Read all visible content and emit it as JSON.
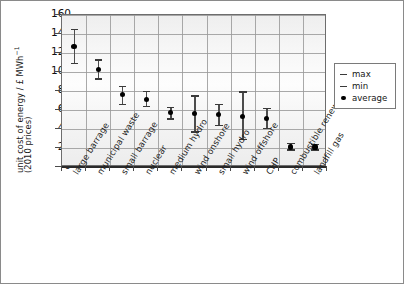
{
  "axis": {
    "y_title_line1": "unit cost of energy / £ MWh",
    "y_title_sup": "−1",
    "y_title_line2": "(2010 prices)",
    "y_ticks": [
      0,
      20,
      40,
      60,
      80,
      100,
      120,
      140,
      160
    ],
    "y_min": 0,
    "y_max": 160
  },
  "legend": {
    "position": "right",
    "items": [
      {
        "label": "max",
        "key": "dash"
      },
      {
        "label": "min",
        "key": "dash"
      },
      {
        "label": "average",
        "key": "dot"
      }
    ]
  },
  "colors": {
    "marker": "#000000",
    "errorbar": "#4c4c4c",
    "panel": "#f3f3f3",
    "grid": "#9a9a9a",
    "axis": "#2a2a2a"
  },
  "chart_data": {
    "type": "scatter",
    "title": "",
    "xlabel": "",
    "ylabel": "unit cost of energy / £ MWh−1 (2010 prices)",
    "ylim": [
      0,
      160
    ],
    "ytick_step": 20,
    "grid": true,
    "legend_position": "right",
    "categories": [
      "large barrage",
      "municipal waste",
      "small barrage",
      "nuclear",
      "medium hydro",
      "wind onshore",
      "small hydro",
      "wind offshore",
      "CHP",
      "combustible renewable",
      "landfill gas"
    ],
    "series": [
      {
        "name": "average",
        "values": [
          127,
          103,
          76,
          71,
          57,
          56,
          55,
          53,
          51,
          21,
          21
        ]
      },
      {
        "name": "min",
        "values": [
          109,
          93,
          66,
          64,
          51,
          37,
          44,
          29,
          41,
          18,
          18
        ]
      },
      {
        "name": "max",
        "values": [
          145,
          113,
          85,
          80,
          63,
          75,
          66,
          79,
          62,
          25,
          24
        ]
      }
    ]
  }
}
